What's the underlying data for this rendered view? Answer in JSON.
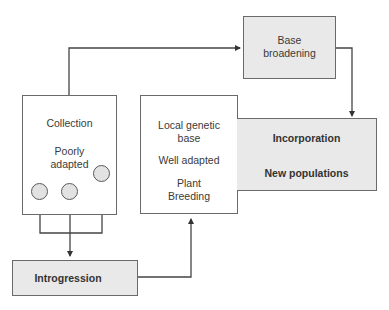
{
  "diagram": {
    "nodes": {
      "base_broadening": {
        "lines": [
          "Base",
          "broadening"
        ],
        "style": "shaded"
      },
      "collection": {
        "title": "Collection",
        "subtitle_lines": [
          "Poorly",
          "adapted"
        ],
        "style": "plain",
        "circles": 3
      },
      "local_genetic_base": {
        "lines": [
          "Local genetic",
          "base"
        ],
        "middle": "Well adapted",
        "bottom_lines": [
          "Plant",
          "Breeding"
        ],
        "style": "plain"
      },
      "incorporation": {
        "title": "Incorporation",
        "bottom": "New populations",
        "style": "shaded"
      },
      "introgression": {
        "label": "Introgression",
        "style": "shaded"
      }
    },
    "edges": [
      {
        "from": "collection",
        "to": "base_broadening"
      },
      {
        "from": "base_broadening",
        "to": "incorporation"
      },
      {
        "from": "incorporation.title",
        "to": "incorporation.new_populations"
      },
      {
        "from": "incorporation.new_populations",
        "to": "local_genetic_base.well_adapted"
      },
      {
        "from": "collection.circles",
        "to": "introgression"
      },
      {
        "from": "introgression",
        "to": "local_genetic_base"
      }
    ],
    "colors": {
      "line": "#444444",
      "box_border": "#6a6a6a",
      "shaded_fill": "#e9e9e9",
      "circle_fill": "#e2e2e2"
    }
  }
}
